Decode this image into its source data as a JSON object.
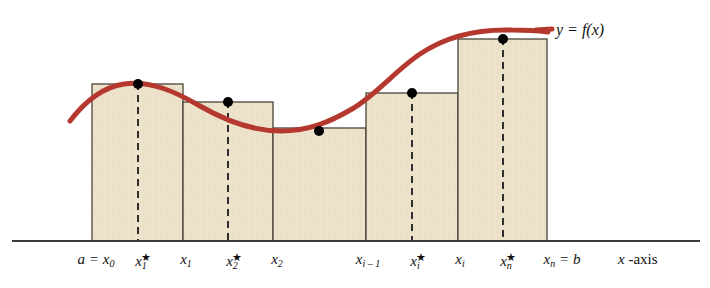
{
  "figure": {
    "background": "#ffffff"
  },
  "colors": {
    "curve": "#b5382f",
    "bar_fill": "#ece2ca",
    "bar_stroke": "#4a4336",
    "axis": "#3a3a36",
    "dot": "#000000",
    "dash": "#1c1c1c",
    "text": "#111111"
  },
  "curve": {
    "label": "y = f(x)",
    "label_x": 556,
    "label_y": 22,
    "stroke_width": 5,
    "path": "M 70,121 C 86,100 104,87 124,84 C 150,80 176,92 200,106 C 226,121 252,131 281,131 C 308,131 330,122 352,109 C 376,95 396,70 420,54 C 448,35 480,29 512,30 C 528,30 540,31 548,32"
  },
  "axis": {
    "label_prefix_italic": "x",
    "label_suffix": " -axis",
    "label_x": 618,
    "label_y": 252,
    "baseline_y": 241,
    "x_start": 12,
    "x_end": 700,
    "stroke_width": 2
  },
  "chart_data": {
    "type": "bar",
    "xlabel": "x -axis",
    "ylabel": "",
    "grid": false,
    "legend": "none",
    "baseline_y": 241,
    "categories": [
      "x1*",
      "x2*",
      "(gap)",
      "xi*",
      "xn*"
    ],
    "bars": [
      {
        "index": 1,
        "x_left": 92,
        "x_right": 183,
        "top_y": 84,
        "sample_x": 138,
        "sample_label": "x1*",
        "has_dot": true,
        "has_dash": true
      },
      {
        "index": 2,
        "x_left": 183,
        "x_right": 273,
        "top_y": 102,
        "sample_x": 228,
        "sample_label": "x2*",
        "has_dot": true,
        "has_dash": true
      },
      {
        "index": 3,
        "x_left": 273,
        "x_right": 366,
        "top_y": 128,
        "sample_x": 319,
        "sample_label": "",
        "has_dot": true,
        "has_dash": false
      },
      {
        "index": 4,
        "x_left": 366,
        "x_right": 458,
        "top_y": 93,
        "sample_x": 412,
        "sample_label": "xi*",
        "has_dot": true,
        "has_dash": true
      },
      {
        "index": 5,
        "x_left": 458,
        "x_right": 547,
        "top_y": 39,
        "sample_x": 503,
        "sample_label": "xn*",
        "has_dot": true,
        "has_dash": true
      }
    ],
    "dots": [
      {
        "x": 138,
        "y": 84
      },
      {
        "x": 228,
        "y": 102
      },
      {
        "x": 319,
        "y": 131
      },
      {
        "x": 412,
        "y": 93
      },
      {
        "x": 503,
        "y": 39
      }
    ],
    "tick_labels": [
      {
        "id": "a-x0",
        "x": 96,
        "base": "a = x",
        "sub": "0",
        "star": false,
        "equals_b": false
      },
      {
        "id": "x1star",
        "x": 141,
        "base": "x",
        "sub": "1",
        "star": true,
        "equals_b": false
      },
      {
        "id": "x1",
        "x": 186,
        "base": "x",
        "sub": "1",
        "star": false,
        "equals_b": false
      },
      {
        "id": "x2star",
        "x": 232,
        "base": "x",
        "sub": "2",
        "star": true,
        "equals_b": false
      },
      {
        "id": "x2",
        "x": 277,
        "base": "x",
        "sub": "2",
        "star": false,
        "equals_b": false
      },
      {
        "id": "xi-1",
        "x": 368,
        "base": "x",
        "sub": "i – 1",
        "star": false,
        "equals_b": false
      },
      {
        "id": "xistar",
        "x": 415,
        "base": "x",
        "sub": "i",
        "star": true,
        "equals_b": false
      },
      {
        "id": "xi",
        "x": 460,
        "base": "x",
        "sub": "i",
        "star": false,
        "equals_b": false
      },
      {
        "id": "xnstar",
        "x": 506,
        "base": "x",
        "sub": "n",
        "star": true,
        "equals_b": false
      },
      {
        "id": "xn-b",
        "x": 562,
        "base": "x",
        "sub": "n",
        "star": false,
        "equals_b": true,
        "suffix": " = b"
      }
    ]
  }
}
